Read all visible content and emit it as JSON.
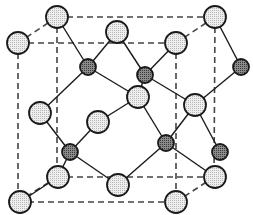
{
  "diagram": {
    "title": "Crystal unit cell (zinc blende / diamond-type structure)",
    "colors": {
      "background": "#ffffff",
      "stroke": "#1a1a1a",
      "light_atom_fill": "#dcdcdc",
      "dark_atom_fill": "#6e6e6e"
    },
    "light_atom_radius": 11,
    "dark_atom_radius": 8,
    "cell_edges": [
      [
        57,
        17,
        215,
        17
      ],
      [
        18,
        43,
        176,
        43
      ],
      [
        57,
        177,
        214,
        177
      ],
      [
        18,
        202,
        176,
        202
      ],
      [
        57,
        17,
        57,
        177
      ],
      [
        215,
        17,
        214,
        177
      ],
      [
        18,
        43,
        18,
        202
      ],
      [
        176,
        43,
        176,
        202
      ],
      [
        18,
        43,
        57,
        17
      ],
      [
        176,
        43,
        215,
        17
      ],
      [
        18,
        202,
        57,
        177
      ],
      [
        176,
        202,
        214,
        177
      ]
    ],
    "light_atoms": [
      {
        "id": "A1",
        "x": 57,
        "y": 17
      },
      {
        "id": "A2",
        "x": 215,
        "y": 17
      },
      {
        "id": "A3",
        "x": 18,
        "y": 43
      },
      {
        "id": "A4",
        "x": 117,
        "y": 32
      },
      {
        "id": "A5",
        "x": 176,
        "y": 43
      },
      {
        "id": "A6",
        "x": 138,
        "y": 97
      },
      {
        "id": "A7",
        "x": 195,
        "y": 105
      },
      {
        "id": "A8",
        "x": 40,
        "y": 113
      },
      {
        "id": "A9",
        "x": 98,
        "y": 122
      },
      {
        "id": "A10",
        "x": 58,
        "y": 177
      },
      {
        "id": "A11",
        "x": 118,
        "y": 185
      },
      {
        "id": "A12",
        "x": 215,
        "y": 177
      },
      {
        "id": "A13",
        "x": 20,
        "y": 202
      },
      {
        "id": "A14",
        "x": 176,
        "y": 202
      }
    ],
    "dark_atoms": [
      {
        "id": "B1",
        "x": 88,
        "y": 67
      },
      {
        "id": "B2",
        "x": 145,
        "y": 75
      },
      {
        "id": "B3",
        "x": 241,
        "y": 67
      },
      {
        "id": "B4",
        "x": 70,
        "y": 152
      },
      {
        "id": "B5",
        "x": 166,
        "y": 143
      },
      {
        "id": "B6",
        "x": 220,
        "y": 152
      }
    ],
    "bonds": [
      [
        "A1",
        "B1"
      ],
      [
        "A4",
        "B1"
      ],
      [
        "B1",
        "A8"
      ],
      [
        "B1",
        "A6"
      ],
      [
        "A4",
        "B2"
      ],
      [
        "A5",
        "B2"
      ],
      [
        "B2",
        "A6"
      ],
      [
        "B2",
        "A7"
      ],
      [
        "A2",
        "B3"
      ],
      [
        "B3",
        "A7"
      ],
      [
        "A6",
        "B5"
      ],
      [
        "A7",
        "B5"
      ],
      [
        "B5",
        "A11"
      ],
      [
        "B5",
        "A12"
      ],
      [
        "A7",
        "B6"
      ],
      [
        "A8",
        "B4"
      ],
      [
        "A9",
        "B4"
      ],
      [
        "B4",
        "A10"
      ],
      [
        "B4",
        "A11"
      ],
      [
        "A9",
        "A6"
      ],
      [
        "A10",
        "A13"
      ]
    ]
  }
}
